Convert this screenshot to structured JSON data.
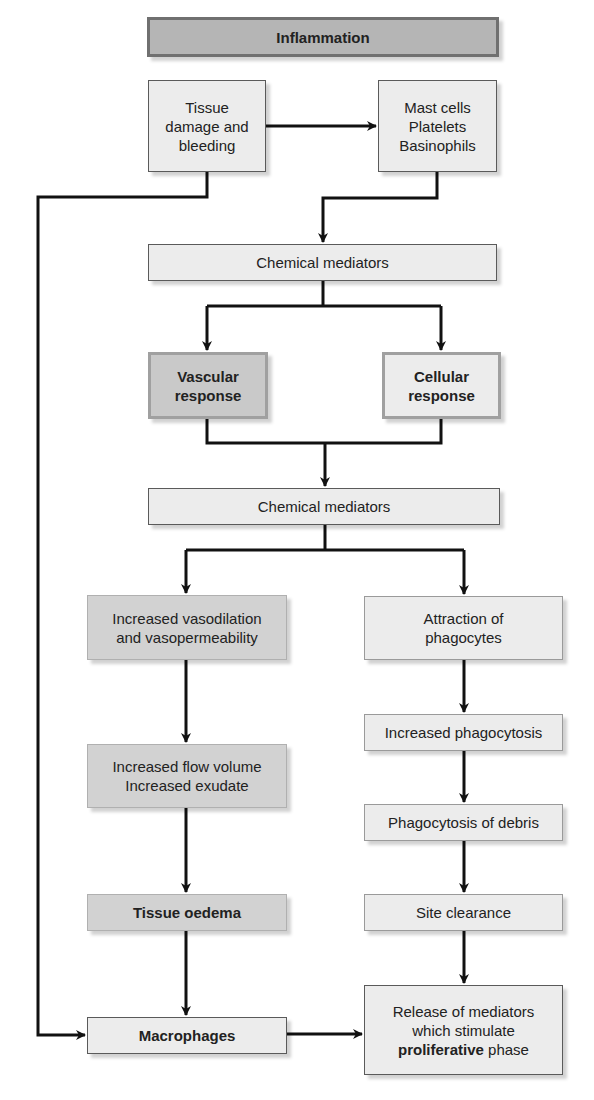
{
  "diagram": {
    "title": "Inflammation",
    "nodes": {
      "tissue_damage": {
        "lines": [
          "Tissue",
          "damage and",
          "bleeding"
        ]
      },
      "mast_cells": {
        "lines": [
          "Mast cells",
          "Platelets",
          "Basinophils"
        ]
      },
      "chemical_mediators_1": {
        "label": "Chemical mediators"
      },
      "vascular_response": {
        "lines": [
          "Vascular",
          "response"
        ]
      },
      "cellular_response": {
        "lines": [
          "Cellular",
          "response"
        ]
      },
      "chemical_mediators_2": {
        "label": "Chemical mediators"
      },
      "vasodilation": {
        "lines": [
          "Increased vasodilation",
          "and vasopermeability"
        ]
      },
      "attraction": {
        "lines": [
          "Attraction of",
          "phagocytes"
        ]
      },
      "increased_phagocytosis": {
        "label": "Increased phagocytosis"
      },
      "flow_volume": {
        "lines": [
          "Increased flow volume",
          "Increased exudate"
        ]
      },
      "phagocytosis_debris": {
        "label": "Phagocytosis of debris"
      },
      "tissue_oedema": {
        "label": "Tissue oedema"
      },
      "site_clearance": {
        "label": "Site clearance"
      },
      "macrophages": {
        "label": "Macrophages"
      },
      "release_mediators": {
        "line1": "Release of mediators",
        "line2": "which stimulate",
        "line3_bold": "proliferative",
        "line3_rest": " phase"
      }
    },
    "edges": [
      [
        "tissue_damage",
        "mast_cells"
      ],
      [
        "mast_cells",
        "chemical_mediators_1"
      ],
      [
        "tissue_damage",
        "macrophages"
      ],
      [
        "chemical_mediators_1",
        "vascular_response"
      ],
      [
        "chemical_mediators_1",
        "cellular_response"
      ],
      [
        "vascular_response",
        "chemical_mediators_2"
      ],
      [
        "cellular_response",
        "chemical_mediators_2"
      ],
      [
        "chemical_mediators_2",
        "vasodilation"
      ],
      [
        "chemical_mediators_2",
        "attraction"
      ],
      [
        "vasodilation",
        "flow_volume"
      ],
      [
        "flow_volume",
        "tissue_oedema"
      ],
      [
        "tissue_oedema",
        "macrophages"
      ],
      [
        "attraction",
        "increased_phagocytosis"
      ],
      [
        "increased_phagocytosis",
        "phagocytosis_debris"
      ],
      [
        "phagocytosis_debris",
        "site_clearance"
      ],
      [
        "site_clearance",
        "release_mediators"
      ],
      [
        "macrophages",
        "release_mediators"
      ]
    ],
    "colors": {
      "line": "#111111",
      "light_fill": "#ececec",
      "dark_fill": "#c9c9c9",
      "title_fill": "#b5b5b5"
    }
  }
}
